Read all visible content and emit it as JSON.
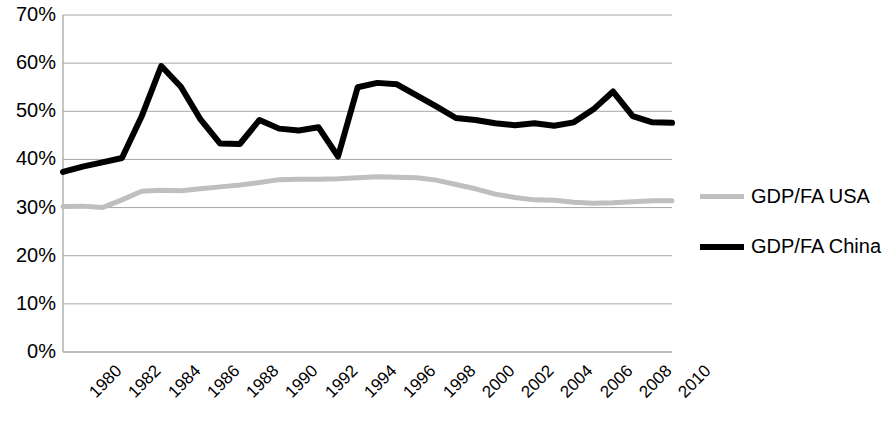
{
  "chart_data": {
    "type": "line",
    "title": "",
    "subtitle": "",
    "xlabel": "",
    "ylabel": "",
    "x": [
      1980,
      1981,
      1982,
      1983,
      1984,
      1985,
      1986,
      1987,
      1988,
      1989,
      1990,
      1991,
      1992,
      1993,
      1994,
      1995,
      1996,
      1997,
      1998,
      1999,
      2000,
      2001,
      2002,
      2003,
      2004,
      2005,
      2006,
      2007,
      2008,
      2009,
      2010,
      2011
    ],
    "x_tick_labels": [
      "1980",
      "1982",
      "1984",
      "1986",
      "1988",
      "1990",
      "1992",
      "1994",
      "1996",
      "1998",
      "2000",
      "2002",
      "2004",
      "2006",
      "2008",
      "2010"
    ],
    "y_tick_labels": [
      "70%",
      "60%",
      "50%",
      "40%",
      "30%",
      "20%",
      "10%",
      "0%"
    ],
    "y_tick_values": [
      70,
      60,
      50,
      40,
      30,
      20,
      10,
      0
    ],
    "ylim": [
      0,
      70
    ],
    "xlim": [
      1980,
      2011
    ],
    "grid": true,
    "grid_axis": "y",
    "legend_position": "right",
    "series": [
      {
        "name": "GDP/FA USA",
        "color": "#bfbfbf",
        "line_width": 5,
        "values": [
          30.2,
          30.3,
          30.0,
          31.6,
          33.4,
          33.6,
          33.5,
          33.9,
          34.3,
          34.7,
          35.2,
          35.8,
          35.9,
          35.9,
          36.0,
          36.2,
          36.4,
          36.3,
          36.2,
          35.7,
          34.8,
          33.9,
          32.8,
          32.1,
          31.6,
          31.5,
          31.1,
          30.9,
          31.0,
          31.2,
          31.4,
          31.4
        ]
      },
      {
        "name": "GDP/FA China",
        "color": "#000000",
        "line_width": 6,
        "values": [
          37.4,
          38.5,
          39.4,
          40.3,
          48.9,
          59.4,
          55.1,
          48.3,
          43.3,
          43.2,
          48.2,
          46.4,
          46.0,
          46.7,
          40.6,
          55.0,
          55.9,
          55.6,
          53.3,
          51.0,
          48.6,
          48.2,
          47.5,
          47.1,
          47.5,
          47.0,
          47.7,
          50.4,
          54.1,
          49.0,
          47.7,
          47.6
        ]
      }
    ]
  },
  "legend": {
    "items": [
      {
        "label": "GDP/FA USA",
        "color": "#bfbfbf"
      },
      {
        "label": "GDP/FA China",
        "color": "#000000"
      }
    ]
  },
  "axes": {
    "plot_left": 63,
    "plot_right": 672,
    "plot_top": 15,
    "plot_bottom": 352,
    "axis_color": "#a6a6a6",
    "grid_color": "#a6a6a6"
  }
}
